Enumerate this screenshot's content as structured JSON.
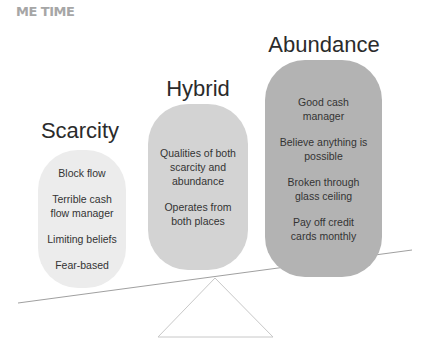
{
  "header": "ME TIME",
  "columns": [
    {
      "title": "Scarcity",
      "color": "#ececec",
      "items": [
        "Block flow",
        "Terrible cash flow manager",
        "Limiting beliefs",
        "Fear-based"
      ]
    },
    {
      "title": "Hybrid",
      "color": "#d3d3d3",
      "items": [
        "Qualities of both scarcity and abundance",
        "Operates from both places"
      ]
    },
    {
      "title": "Abundance",
      "color": "#b3b3b3",
      "items": [
        "Good cash manager",
        "Believe anything is possible",
        "Broken through glass ceiling",
        "Pay off credit cards monthly"
      ]
    }
  ]
}
